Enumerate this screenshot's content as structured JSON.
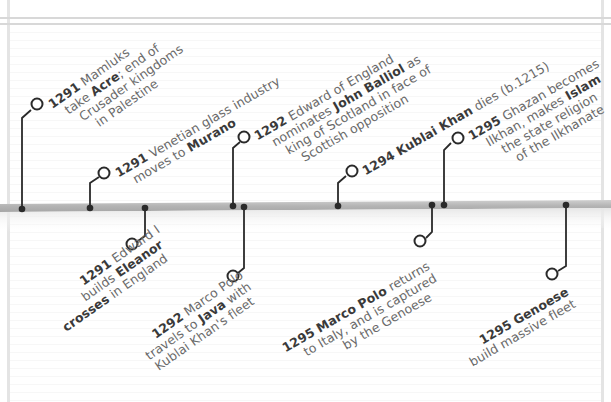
{
  "colors": {
    "background": "#ffffff",
    "bar": "#b9b9b9",
    "connector": "#2a2a2a",
    "text_regular": "#6a6a6a",
    "text_bold": "#3a3a3a",
    "border": "#e0e0e0"
  },
  "timeline": {
    "events_above": [
      {
        "year": "1291",
        "pre": "Mamluks",
        "line2_pre": "take ",
        "bold": "Acre",
        "line2_post": "; end of",
        "line3": "Crusader kingdoms",
        "line4": "in Palestine"
      },
      {
        "year": "1291",
        "pre": "Venetian glass industry",
        "line2_pre": "moves to ",
        "bold": "Murano"
      },
      {
        "year": "1292",
        "pre": "Edward of England",
        "line2_pre": "nominates ",
        "bold": "John Balliol",
        "line2_post": " as",
        "line3": "king of Scotland in face of",
        "line4": "Scottish opposition"
      },
      {
        "year": "1294",
        "bold": "Kublai Khan",
        "post": " dies (b.1215)"
      },
      {
        "year": "1295",
        "pre": "Ghazan becomes",
        "line2_pre": "Ilkhan, makes ",
        "bold": "Islam",
        "line3": "the state religion",
        "line4": "of the Ilkhanate"
      }
    ],
    "events_below": [
      {
        "year": "1291",
        "pre": "Edward I",
        "line2_pre": "builds ",
        "bold": "Eleanor",
        "line3_bold": "crosses",
        "line3_post": " in England"
      },
      {
        "year": "1292",
        "pre": "Marco Polo",
        "line2_pre": "travels to ",
        "bold": "Java",
        "line2_post": " with",
        "line3": "Kublai Khan's fleet"
      },
      {
        "year": "1295",
        "bold": "Marco Polo",
        "post": " returns",
        "line2": "to Italy, and is captured",
        "line3": "by the Genoese"
      },
      {
        "year": "1295",
        "bold": "Genoese",
        "line2": "build massive fleet"
      }
    ]
  }
}
